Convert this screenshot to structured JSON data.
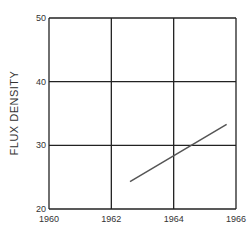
{
  "chart_data": {
    "type": "line",
    "xlabel": "",
    "ylabel": "FLUX DENSITY",
    "xlim": [
      1960,
      1966
    ],
    "ylim": [
      20,
      50
    ],
    "x_ticks": [
      "1960",
      "1962",
      "1964",
      "1966"
    ],
    "y_ticks": [
      "20",
      "30",
      "40",
      "50"
    ],
    "grid": true,
    "legend": null,
    "series": [
      {
        "name": "3.75 CENTIMETERS",
        "x": [
          1962.6,
          1965.7
        ],
        "y": [
          24.3,
          33.3
        ]
      }
    ]
  }
}
